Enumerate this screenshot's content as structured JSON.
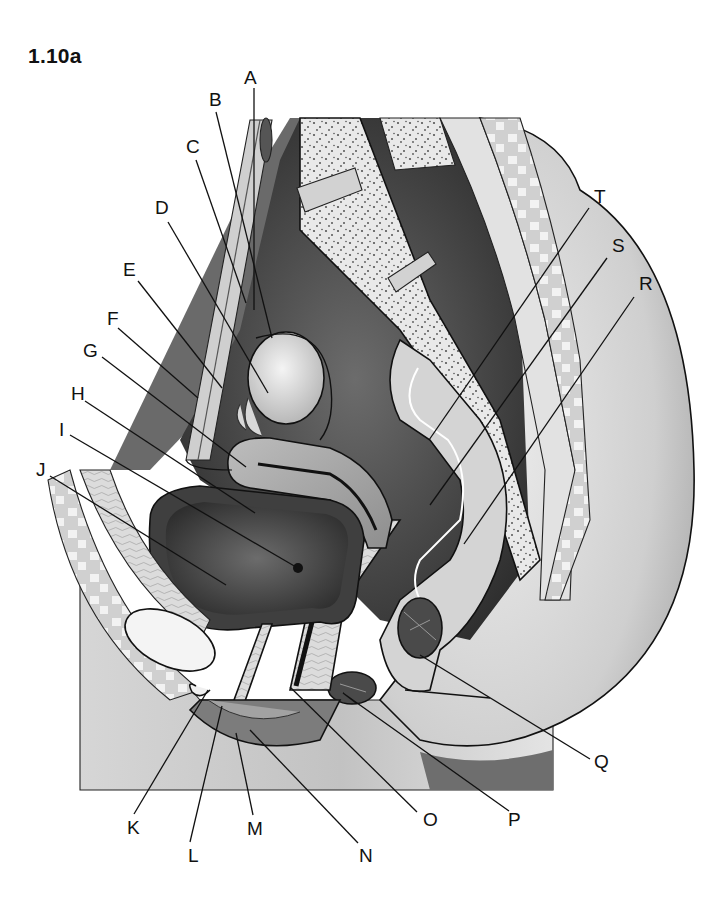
{
  "figure": {
    "id_label": "1.10a"
  },
  "colors": {
    "background": "#ffffff",
    "ink": "#111111",
    "dark_cavity": "#3a3a3a",
    "mid_gray": "#8a8a8a",
    "light_gray": "#c8c8c8",
    "pale": "#e6e6e6",
    "bone_dot": "#555555"
  },
  "labels": [
    {
      "letter": "A",
      "x": 244,
      "y": 84,
      "line": [
        [
          254,
          88
        ],
        [
          254,
          310
        ]
      ]
    },
    {
      "letter": "B",
      "x": 209,
      "y": 106,
      "line": [
        [
          216,
          112
        ],
        [
          272,
          338
        ]
      ]
    },
    {
      "letter": "C",
      "x": 186,
      "y": 153,
      "line": [
        [
          196,
          160
        ],
        [
          246,
          303
        ]
      ]
    },
    {
      "letter": "D",
      "x": 155,
      "y": 214,
      "line": [
        [
          168,
          222
        ],
        [
          268,
          393
        ]
      ]
    },
    {
      "letter": "E",
      "x": 123,
      "y": 276,
      "line": [
        [
          138,
          281
        ],
        [
          222,
          388
        ]
      ]
    },
    {
      "letter": "F",
      "x": 107,
      "y": 325,
      "line": [
        [
          118,
          328
        ],
        [
          198,
          398
        ]
      ]
    },
    {
      "letter": "G",
      "x": 83,
      "y": 357,
      "line": [
        [
          102,
          357
        ],
        [
          246,
          467
        ]
      ]
    },
    {
      "letter": "H",
      "x": 71,
      "y": 400,
      "line": [
        [
          85,
          401
        ],
        [
          255,
          513
        ]
      ]
    },
    {
      "letter": "I",
      "x": 59,
      "y": 436,
      "line": [
        [
          70,
          435
        ],
        [
          296,
          567
        ]
      ]
    },
    {
      "letter": "J",
      "x": 36,
      "y": 476,
      "line": [
        [
          50,
          476
        ],
        [
          226,
          585
        ]
      ]
    },
    {
      "letter": "K",
      "x": 127,
      "y": 834,
      "line": [
        [
          134,
          814
        ],
        [
          208,
          690
        ]
      ]
    },
    {
      "letter": "L",
      "x": 188,
      "y": 862,
      "line": [
        [
          190,
          842
        ],
        [
          222,
          706
        ]
      ]
    },
    {
      "letter": "M",
      "x": 247,
      "y": 835,
      "line": [
        [
          253,
          815
        ],
        [
          236,
          733
        ]
      ]
    },
    {
      "letter": "N",
      "x": 359,
      "y": 862,
      "line": [
        [
          358,
          843
        ],
        [
          250,
          730
        ]
      ]
    },
    {
      "letter": "O",
      "x": 423,
      "y": 826,
      "line": [
        [
          417,
          812
        ],
        [
          290,
          687
        ]
      ]
    },
    {
      "letter": "P",
      "x": 508,
      "y": 826,
      "line": [
        [
          509,
          811
        ],
        [
          343,
          693
        ],
        [
          356,
          703
        ]
      ]
    },
    {
      "letter": "Q",
      "x": 594,
      "y": 768,
      "line": [
        [
          590,
          759
        ],
        [
          420,
          655
        ]
      ]
    },
    {
      "letter": "R",
      "x": 639,
      "y": 290,
      "line": [
        [
          634,
          297
        ],
        [
          464,
          544
        ]
      ]
    },
    {
      "letter": "S",
      "x": 612,
      "y": 252,
      "line": [
        [
          607,
          258
        ],
        [
          430,
          505
        ]
      ]
    },
    {
      "letter": "T",
      "x": 594,
      "y": 203,
      "line": [
        [
          589,
          208
        ],
        [
          429,
          440
        ]
      ]
    }
  ],
  "q_second_line": [
    [
      490,
      698
    ],
    [
      405,
      690
    ]
  ],
  "annotations": {
    "structures_shown": [
      "sacrum",
      "coccyx",
      "uterus",
      "ovary",
      "uterine tube",
      "urinary bladder",
      "pubic symphysis",
      "urethra",
      "vagina",
      "rectum",
      "anal canal",
      "rectouterine pouch",
      "vesicouterine pouch",
      "labia",
      "clitoris"
    ]
  }
}
